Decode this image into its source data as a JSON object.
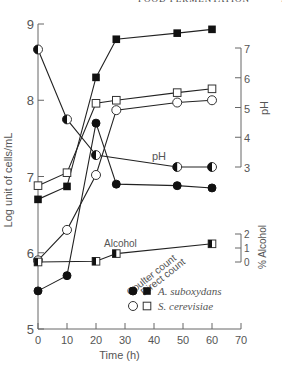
{
  "header": {
    "running_title": "FOOD FERMENTATION",
    "page_number": "5"
  },
  "chart_data": {
    "type": "line",
    "title": "",
    "xlabel": "Time (h)",
    "ylabel": "Log unit of cells/mL",
    "y2label": "pH",
    "y3label": "% Alcohol",
    "xlim": [
      0,
      70
    ],
    "ylim": [
      5,
      9
    ],
    "y2lim": [
      3,
      7
    ],
    "y3lim": [
      0,
      2
    ],
    "x_ticks": [
      0,
      10,
      20,
      30,
      40,
      50,
      60,
      70
    ],
    "y_ticks": [
      5,
      6,
      7,
      8,
      9
    ],
    "y2_ticks": [
      3,
      4,
      5,
      6,
      7
    ],
    "y3_ticks": [
      0,
      1,
      2
    ],
    "grid": false,
    "annotations": [
      "pH",
      "Alcohol",
      "Coulter count",
      "Direct count"
    ],
    "legend": {
      "position": "lower right inside",
      "column_headers": [
        "Coulter count",
        "Direct count"
      ],
      "entries": [
        {
          "label": "A. suboxydans",
          "coulter_marker": "filled-circle",
          "direct_marker": "filled-square"
        },
        {
          "label": "S. cerevisiae",
          "coulter_marker": "open-circle",
          "direct_marker": "open-square"
        }
      ]
    },
    "series": [
      {
        "name": "A. suboxydans (Coulter count)",
        "axis": "left",
        "marker": "filled-circle",
        "x": [
          0,
          10,
          20,
          27,
          48,
          60
        ],
        "values": [
          5.5,
          5.7,
          7.7,
          6.9,
          6.88,
          6.85
        ]
      },
      {
        "name": "A. suboxydans (Direct count)",
        "axis": "left",
        "marker": "filled-square",
        "x": [
          0,
          10,
          20,
          27,
          48,
          60
        ],
        "values": [
          6.7,
          6.87,
          8.3,
          8.8,
          8.88,
          8.93
        ]
      },
      {
        "name": "S. cerevisiae (Coulter count)",
        "axis": "left",
        "marker": "open-circle",
        "x": [
          0,
          10,
          20,
          27,
          48,
          60
        ],
        "values": [
          5.9,
          6.3,
          7.02,
          7.87,
          7.97,
          8.0
        ]
      },
      {
        "name": "S. cerevisiae (Direct count)",
        "axis": "left",
        "marker": "open-square",
        "x": [
          0,
          10,
          20,
          27,
          48,
          60
        ],
        "values": [
          6.88,
          7.05,
          7.96,
          8.0,
          8.1,
          8.15
        ]
      },
      {
        "name": "pH",
        "axis": "right-pH",
        "marker": "half-filled-circle",
        "x": [
          0,
          10,
          20,
          48,
          60
        ],
        "values": [
          6.95,
          4.6,
          3.4,
          3.0,
          3.0
        ]
      },
      {
        "name": "% Alcohol",
        "axis": "right-alcohol",
        "marker": "half-filled-square",
        "x": [
          0,
          20,
          27,
          60
        ],
        "values": [
          0.0,
          0.05,
          0.6,
          1.3
        ]
      }
    ]
  }
}
